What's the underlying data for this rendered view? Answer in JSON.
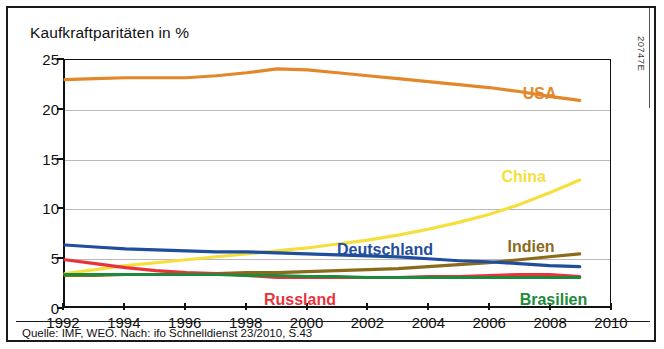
{
  "figure": {
    "catalog_code": "20747E",
    "source_note": "Quelle: IMF, WEO. Nach: ifo Schnelldienst 23/2010, S.43"
  },
  "chart_data": {
    "type": "line",
    "title": "Kaufkraftparitäten in %",
    "subtitle": "",
    "xlabel": "",
    "ylabel": "",
    "xlim": [
      1992,
      2010
    ],
    "ylim": [
      0,
      25
    ],
    "grid": true,
    "legend_position": "inline-labels",
    "y_ticks": [
      0,
      5,
      10,
      15,
      20,
      25
    ],
    "x_ticks": [
      1992,
      1994,
      1996,
      1998,
      2000,
      2002,
      2004,
      2006,
      2008,
      2010
    ],
    "x": [
      1992,
      1993,
      1994,
      1995,
      1996,
      1997,
      1998,
      1999,
      2000,
      2001,
      2002,
      2003,
      2004,
      2005,
      2006,
      2007,
      2008,
      2009
    ],
    "series": [
      {
        "name": "USA",
        "color": "#E3872B",
        "label_x": 2007.1,
        "label_y": 22.3,
        "values": [
          23.0,
          23.1,
          23.2,
          23.2,
          23.2,
          23.4,
          23.7,
          24.1,
          24.0,
          23.7,
          23.4,
          23.1,
          22.8,
          22.5,
          22.2,
          21.8,
          21.3,
          20.9
        ]
      },
      {
        "name": "China",
        "color": "#F5DF3C",
        "label_x": 2006.4,
        "label_y": 14.0,
        "values": [
          3.3,
          3.7,
          4.1,
          4.4,
          4.7,
          5.0,
          5.3,
          5.6,
          5.9,
          6.3,
          6.7,
          7.2,
          7.8,
          8.5,
          9.3,
          10.3,
          11.5,
          12.8
        ]
      },
      {
        "name": "Indien",
        "color": "#8A6B1C",
        "label_x": 2006.6,
        "label_y": 6.9,
        "values": [
          3.1,
          3.1,
          3.2,
          3.2,
          3.3,
          3.3,
          3.4,
          3.4,
          3.5,
          3.6,
          3.7,
          3.8,
          4.0,
          4.2,
          4.4,
          4.7,
          5.0,
          5.3
        ]
      },
      {
        "name": "Deutschland",
        "color": "#1F4E9C",
        "label_x": 2001.0,
        "label_y": 6.6,
        "values": [
          6.2,
          6.0,
          5.8,
          5.7,
          5.6,
          5.5,
          5.5,
          5.4,
          5.3,
          5.2,
          5.1,
          5.0,
          4.8,
          4.6,
          4.5,
          4.3,
          4.1,
          4.0
        ]
      },
      {
        "name": "Russland",
        "color": "#E8333C",
        "label_x": 1998.6,
        "label_y": 1.6,
        "values": [
          4.7,
          4.3,
          3.9,
          3.6,
          3.4,
          3.3,
          3.1,
          2.9,
          2.9,
          2.9,
          2.9,
          2.9,
          3.0,
          3.0,
          3.1,
          3.2,
          3.2,
          3.0
        ]
      },
      {
        "name": "Brasilien",
        "color": "#1E8A3C",
        "label_x": 2007.0,
        "label_y": 1.6,
        "values": [
          3.2,
          3.2,
          3.2,
          3.2,
          3.2,
          3.2,
          3.1,
          3.1,
          3.0,
          3.0,
          2.9,
          2.9,
          2.9,
          2.9,
          2.9,
          2.9,
          2.9,
          2.9
        ]
      }
    ]
  }
}
